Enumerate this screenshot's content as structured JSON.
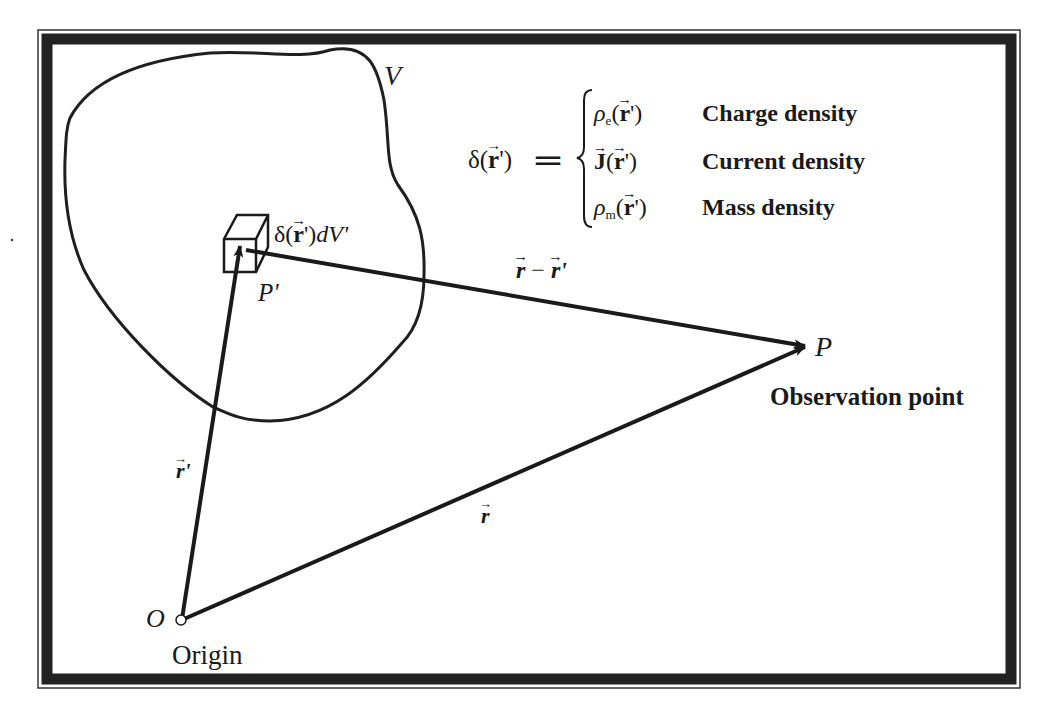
{
  "figure": {
    "type": "vector-geometry-diagram",
    "frame": {
      "border_color": "#222222",
      "background": "#ffffff"
    },
    "region_label": "V",
    "element_label": {
      "prefix": "δ(",
      "vec": "r",
      "suffix": "')",
      "tail": "dV'"
    },
    "source_point_label": "P'",
    "observation_point": {
      "label": "P",
      "caption": "Observation point"
    },
    "origin": {
      "label": "O",
      "caption": "Origin"
    },
    "vectors": {
      "source": {
        "label": "r",
        "prime": "'"
      },
      "field": {
        "label": "r",
        "prime": ""
      },
      "separation": {
        "a": "r",
        "minus": " − ",
        "b": "r",
        "prime": "'"
      }
    },
    "equation": {
      "lhs": "δ(r')",
      "lhs_prefix": "δ(",
      "lhs_vec": "r",
      "lhs_suffix": "')",
      "equals": "═",
      "cases": [
        {
          "symbol": "ρ",
          "sub": "e",
          "arg_prefix": "(",
          "arg_vec": "r",
          "arg_suffix": "')",
          "description": "Charge density"
        },
        {
          "symbol": "J",
          "sub": "",
          "arg_prefix": "(",
          "arg_vec": "r",
          "arg_suffix": "')",
          "description": "Current density"
        },
        {
          "symbol": "ρ",
          "sub": "m",
          "arg_prefix": "(",
          "arg_vec": "r",
          "arg_suffix": "')",
          "description": "Mass density"
        }
      ]
    }
  }
}
